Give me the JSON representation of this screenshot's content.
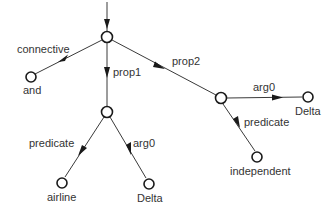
{
  "diagram": {
    "type": "directed-graph",
    "colors": {
      "line": "#3a3a3a",
      "node_stroke": "#1a1a1a",
      "node_fill": "#ffffff",
      "text": "#333333",
      "background": "#ffffff"
    },
    "nodes": [
      {
        "id": "root",
        "label": "",
        "x": 107,
        "y": 37
      },
      {
        "id": "and",
        "label": "and",
        "x": 31,
        "y": 77
      },
      {
        "id": "p1",
        "label": "",
        "x": 107,
        "y": 112
      },
      {
        "id": "p2",
        "label": "",
        "x": 221,
        "y": 98
      },
      {
        "id": "delta1",
        "label": "Delta",
        "x": 308,
        "y": 97
      },
      {
        "id": "independent",
        "label": "independent",
        "x": 257,
        "y": 157
      },
      {
        "id": "airline",
        "label": "airline",
        "x": 62,
        "y": 183
      },
      {
        "id": "delta2",
        "label": "Delta",
        "x": 149,
        "y": 184
      }
    ],
    "edges": [
      {
        "from": "entry",
        "to": "root",
        "label": ""
      },
      {
        "from": "root",
        "to": "and",
        "label": "connective"
      },
      {
        "from": "root",
        "to": "p1",
        "label": "prop1"
      },
      {
        "from": "root",
        "to": "p2",
        "label": "prop2"
      },
      {
        "from": "p2",
        "to": "delta1",
        "label": "arg0"
      },
      {
        "from": "p2",
        "to": "independent",
        "label": "predicate"
      },
      {
        "from": "p1",
        "to": "airline",
        "label": "predicate"
      },
      {
        "from": "p1",
        "to": "delta2",
        "label": "arg0"
      }
    ]
  }
}
